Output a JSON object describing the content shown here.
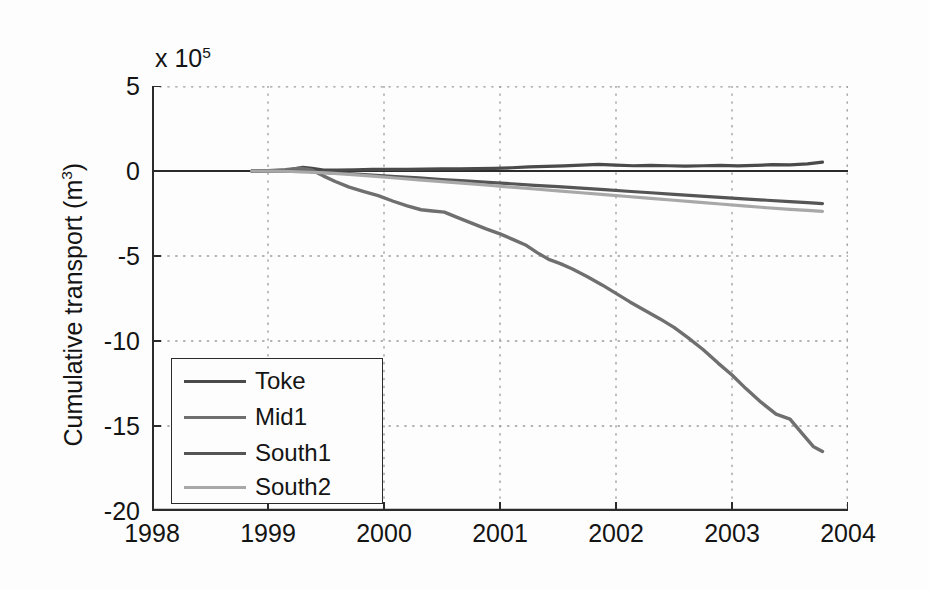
{
  "chart_data": {
    "type": "line",
    "title": "",
    "xlabel": "",
    "ylabel": "Cumulative transport (m3)",
    "ylabel_base": "Cumulative transport (m",
    "ylabel_sup": "3",
    "ylabel_close": ")",
    "y_exponent_prefix": "x 10",
    "y_exponent_power": "5",
    "y_unit_multiplier": 100000,
    "xlim": [
      1998,
      2004
    ],
    "ylim": [
      -20,
      5
    ],
    "xticks": [
      "1998",
      "1999",
      "2000",
      "2001",
      "2002",
      "2003",
      "2004"
    ],
    "xtick_values": [
      1998,
      1999,
      2000,
      2001,
      2002,
      2003,
      2004
    ],
    "yticks": [
      "5",
      "0",
      "-5",
      "-10",
      "-15",
      "-20"
    ],
    "ytick_values": [
      5,
      0,
      -5,
      -10,
      -15,
      -20
    ],
    "grid": "dotted",
    "legend_position": "lower-left",
    "background": "#fdfdfd",
    "axis_color": "#2b2b2b",
    "grid_color": "#9a9a9a",
    "series": [
      {
        "name": "Toke",
        "color": "#4a4a4a",
        "width": 3.2,
        "x": [
          1998.86,
          1999.0,
          1999.12,
          1999.22,
          1999.3,
          1999.38,
          1999.48,
          1999.6,
          1999.75,
          1999.9,
          2000.05,
          2000.2,
          2000.35,
          2000.5,
          2000.65,
          2000.8,
          2000.95,
          2001.1,
          2001.25,
          2001.4,
          2001.55,
          2001.7,
          2001.85,
          2002.0,
          2002.15,
          2002.3,
          2002.45,
          2002.6,
          2002.75,
          2002.9,
          2003.05,
          2003.2,
          2003.35,
          2003.5,
          2003.65,
          2003.78
        ],
        "y": [
          0.0,
          0.02,
          0.01,
          0.12,
          0.22,
          0.16,
          0.06,
          0.05,
          0.07,
          0.09,
          0.1,
          0.09,
          0.11,
          0.13,
          0.12,
          0.14,
          0.16,
          0.19,
          0.24,
          0.27,
          0.3,
          0.34,
          0.39,
          0.34,
          0.31,
          0.33,
          0.31,
          0.29,
          0.31,
          0.33,
          0.3,
          0.33,
          0.37,
          0.36,
          0.42,
          0.52
        ]
      },
      {
        "name": "Mid1",
        "color": "#6f6f6f",
        "width": 3.4,
        "x": [
          1998.86,
          1999.0,
          1999.15,
          1999.28,
          1999.38,
          1999.48,
          1999.58,
          1999.7,
          1999.82,
          1999.95,
          2000.08,
          2000.2,
          2000.32,
          2000.42,
          2000.52,
          2000.62,
          2000.75,
          2000.88,
          2001.0,
          2001.12,
          2001.22,
          2001.32,
          2001.42,
          2001.52,
          2001.62,
          2001.75,
          2001.88,
          2002.0,
          2002.12,
          2002.25,
          2002.38,
          2002.5,
          2002.62,
          2002.75,
          2002.88,
          2003.0,
          2003.12,
          2003.25,
          2003.38,
          2003.5,
          2003.6,
          2003.7,
          2003.78
        ],
        "y": [
          0.0,
          0.02,
          0.08,
          0.16,
          0.05,
          -0.3,
          -0.62,
          -0.95,
          -1.2,
          -1.45,
          -1.78,
          -2.05,
          -2.28,
          -2.35,
          -2.42,
          -2.7,
          -3.05,
          -3.4,
          -3.7,
          -4.05,
          -4.35,
          -4.8,
          -5.2,
          -5.45,
          -5.75,
          -6.2,
          -6.7,
          -7.2,
          -7.7,
          -8.2,
          -8.7,
          -9.2,
          -9.8,
          -10.5,
          -11.3,
          -12.0,
          -12.8,
          -13.6,
          -14.3,
          -14.6,
          -15.4,
          -16.2,
          -16.5
        ]
      },
      {
        "name": "South1",
        "color": "#555555",
        "width": 3.2,
        "x": [
          1998.86,
          1999.05,
          1999.2,
          1999.35,
          1999.5,
          1999.7,
          1999.9,
          2000.1,
          2000.3,
          2000.5,
          2000.7,
          2000.9,
          2001.1,
          2001.3,
          2001.5,
          2001.7,
          2001.9,
          2002.1,
          2002.3,
          2002.5,
          2002.7,
          2002.9,
          2003.1,
          2003.3,
          2003.5,
          2003.65,
          2003.78
        ],
        "y": [
          0.0,
          -0.01,
          -0.02,
          -0.04,
          -0.09,
          -0.16,
          -0.24,
          -0.33,
          -0.41,
          -0.5,
          -0.58,
          -0.67,
          -0.75,
          -0.84,
          -0.92,
          -1.01,
          -1.1,
          -1.19,
          -1.28,
          -1.37,
          -1.46,
          -1.55,
          -1.64,
          -1.72,
          -1.8,
          -1.86,
          -1.92
        ]
      },
      {
        "name": "South2",
        "color": "#a8a8a8",
        "width": 3.2,
        "x": [
          1998.86,
          1999.05,
          1999.2,
          1999.35,
          1999.5,
          1999.7,
          1999.9,
          2000.1,
          2000.3,
          2000.5,
          2000.7,
          2000.9,
          2001.1,
          2001.3,
          2001.5,
          2001.7,
          2001.9,
          2002.1,
          2002.3,
          2002.5,
          2002.7,
          2002.9,
          2003.1,
          2003.3,
          2003.5,
          2003.65,
          2003.78
        ],
        "y": [
          0.0,
          -0.01,
          -0.03,
          -0.06,
          -0.11,
          -0.2,
          -0.3,
          -0.41,
          -0.52,
          -0.63,
          -0.73,
          -0.84,
          -0.95,
          -1.06,
          -1.17,
          -1.28,
          -1.39,
          -1.5,
          -1.61,
          -1.72,
          -1.83,
          -1.94,
          -2.05,
          -2.16,
          -2.26,
          -2.32,
          -2.38
        ]
      }
    ],
    "zero_line": {
      "value": 0,
      "color": "#2b2b2b"
    }
  },
  "legend": {
    "items": [
      {
        "label": "Toke"
      },
      {
        "label": "Mid1"
      },
      {
        "label": "South1"
      },
      {
        "label": "South2"
      }
    ]
  }
}
